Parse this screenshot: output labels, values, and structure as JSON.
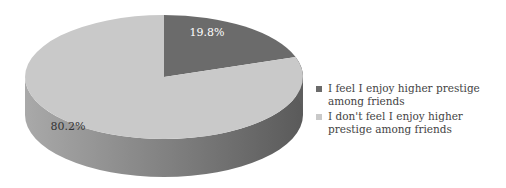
{
  "chart_data": {
    "type": "pie",
    "style": "3d",
    "title": "",
    "slices": [
      {
        "label": "I feel  I enjoy higher prestige among friends",
        "value": 19.8,
        "data_label": "19.8%",
        "color": "#6b6b6b",
        "side_color": "#555555"
      },
      {
        "label": "I don't feel  I enjoy higher prestige among friends",
        "value": 80.2,
        "data_label": "80.2%",
        "color": "#c9c9c9",
        "side_color": "#9a9a9a"
      }
    ],
    "legend_position": "right",
    "start_angle": "12 o'clock",
    "direction": "clockwise"
  }
}
